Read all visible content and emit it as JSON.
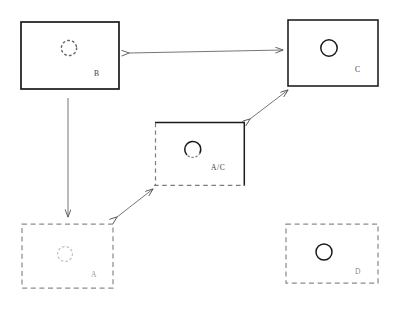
{
  "diagram": {
    "background_color": "#ffffff",
    "stroke_color": "#1a1a1a",
    "faint_stroke_color": "#b9b9b9",
    "arrow_color": "#555555",
    "width": 402,
    "height": 311,
    "boxes": [
      {
        "id": "B",
        "label": "B",
        "border_style": "solid",
        "x": 21,
        "y": 22,
        "w": 98,
        "h": 67,
        "label_x": 96,
        "label_y": 76,
        "circle": {
          "style": "dotted",
          "cx": 69,
          "cy": 48,
          "r": 8
        }
      },
      {
        "id": "C",
        "label": "C",
        "border_style": "solid",
        "x": 288,
        "y": 20,
        "w": 90,
        "h": 66,
        "label_x": 357,
        "label_y": 72,
        "circle": {
          "style": "solid",
          "cx": 329,
          "cy": 48,
          "r": 8
        }
      },
      {
        "id": "AC",
        "label": "A/C",
        "border_style": "mixed-solid-top-right-dashed-left-bottom",
        "x": 155,
        "y": 122,
        "w": 90,
        "h": 63,
        "label_x": 213,
        "label_y": 170,
        "circle": {
          "style": "half-solid-half-dotted",
          "cx": 193,
          "cy": 150,
          "r": 8
        }
      },
      {
        "id": "A",
        "label": "A",
        "border_style": "dashed",
        "x": 22,
        "y": 224,
        "w": 91,
        "h": 64,
        "label_x": 93,
        "label_y": 277,
        "circle": {
          "style": "dotted-faint",
          "cx": 65,
          "cy": 254,
          "r": 8
        }
      },
      {
        "id": "D",
        "label": "D",
        "border_style": "dashed",
        "x": 286,
        "y": 224,
        "w": 92,
        "h": 59,
        "label_x": 357,
        "label_y": 274,
        "circle": {
          "style": "solid",
          "cx": 324,
          "cy": 252,
          "r": 8
        }
      }
    ],
    "arrows": [
      {
        "id": "b-c",
        "from": "B",
        "to": "C",
        "heads": "double",
        "x1": 129,
        "y1": 53,
        "x2": 283,
        "y2": 50
      },
      {
        "id": "b-a",
        "from": "B",
        "to": "A",
        "heads": "single",
        "x1": 68,
        "y1": 98,
        "x2": 68,
        "y2": 218
      },
      {
        "id": "ac-c",
        "from": "AC",
        "to": "C",
        "heads": "double",
        "x1": 251,
        "y1": 118,
        "x2": 289,
        "y2": 89
      },
      {
        "id": "a-ac",
        "from": "A",
        "to": "AC",
        "heads": "double",
        "x1": 117,
        "y1": 218,
        "x2": 152,
        "y2": 189
      }
    ]
  }
}
